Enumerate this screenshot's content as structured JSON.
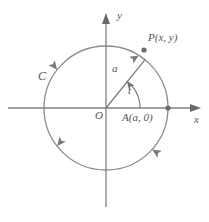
{
  "figure": {
    "colors": {
      "stroke": "#808080",
      "label": "#555555",
      "background": "#ffffff"
    },
    "geometry": {
      "origin_x": 106,
      "origin_y": 108,
      "radius": 62,
      "point_p_angle_deg": 38,
      "arc_angle_deg": 38,
      "x_axis_from": 8,
      "x_axis_to": 201,
      "y_axis_from": 14,
      "y_axis_to": 207
    },
    "labels": {
      "y_axis": "y",
      "x_axis": "x",
      "curve": "C",
      "origin": "O",
      "radius": "a",
      "angle": "t",
      "point_a": "A(a, 0)",
      "point_p": "P(x, y)"
    },
    "direction_arrows": [
      {
        "name": "arrow-upper-left",
        "angle_deg": 142,
        "orientation": "counterclockwise"
      },
      {
        "name": "arrow-upper-right",
        "angle_deg": 58,
        "orientation": "counterclockwise"
      },
      {
        "name": "arrow-lower-left",
        "angle_deg": 218,
        "orientation": "counterclockwise"
      },
      {
        "name": "arrow-lower-right",
        "angle_deg": 318,
        "orientation": "counterclockwise"
      }
    ],
    "points": [
      {
        "name": "point-p-dot",
        "x": 144,
        "y": 50
      },
      {
        "name": "point-a-dot",
        "x": 168,
        "y": 108
      }
    ]
  }
}
